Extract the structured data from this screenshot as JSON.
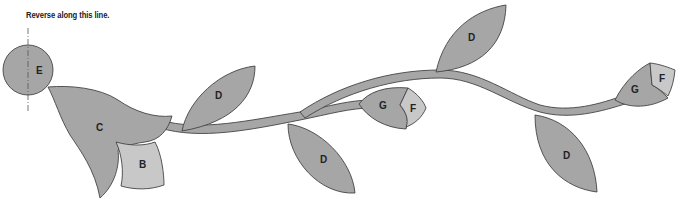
{
  "caption": "Reverse along this line.",
  "colors": {
    "piece_dark": "#a6a6a6",
    "piece_light": "#c8c8c8",
    "outline": "#444444",
    "background": "#ffffff"
  },
  "pieces": {
    "E": "E",
    "C": "C",
    "B": "B",
    "D1": "D",
    "D2": "D",
    "D3": "D",
    "D4": "D",
    "G1": "G",
    "F1": "F",
    "G2": "G",
    "F2": "F"
  }
}
